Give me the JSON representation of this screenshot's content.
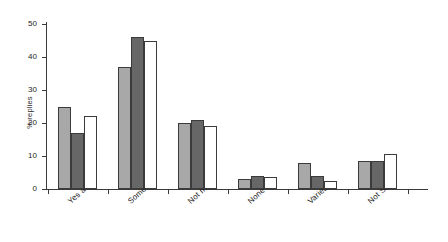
{
  "chart_data": {
    "type": "bar",
    "title": "",
    "xlabel": "",
    "ylabel": "% replies",
    "ylim": [
      0,
      50
    ],
    "yticks": [
      0,
      10,
      20,
      30,
      40,
      50
    ],
    "grid": false,
    "legend": "none",
    "categories": [
      "Yes a lot",
      "Some",
      "Not much",
      "None",
      "Varies",
      "Not Sure"
    ],
    "series": [
      {
        "name": "series-1",
        "style": "light-gray",
        "color": "#a8a8a8",
        "values": [
          25,
          37,
          20,
          3,
          8,
          8.5
        ]
      },
      {
        "name": "series-2",
        "style": "dark-gray",
        "color": "#676767",
        "values": [
          17,
          46,
          21,
          4,
          4,
          8.5
        ]
      },
      {
        "name": "series-3",
        "style": "white",
        "color": "#ffffff",
        "values": [
          22,
          45,
          19,
          3.5,
          2.5,
          10.5
        ]
      }
    ]
  },
  "axis": {
    "y_label_text": "% replies",
    "tick_labels": [
      "0",
      "10",
      "20",
      "30",
      "40",
      "50"
    ],
    "line_color": "#3a3a3a"
  },
  "category_labels": [
    "Yes a lot",
    "Some",
    "Not much",
    "None",
    "Varies",
    "Not Sure"
  ]
}
